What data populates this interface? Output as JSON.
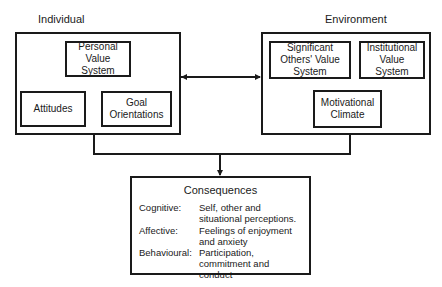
{
  "individual": {
    "title": "Individual",
    "boxes": {
      "personal_value_system": "Personal Value System",
      "attitudes": "Attitudes",
      "goal_orientations": "Goal Orientations"
    }
  },
  "environment": {
    "title": "Environment",
    "boxes": {
      "significant_others": "Significant Others' Value System",
      "institutional": "Institutional Value System",
      "motivational_climate": "Motivational Climate"
    }
  },
  "consequences": {
    "title": "Consequences",
    "rows": [
      {
        "key": "Cognitive:",
        "value": "Self, other and situational perceptions."
      },
      {
        "key": "Affective:",
        "value": "Feelings of enjoyment and anxiety"
      },
      {
        "key": "Behavioural:",
        "value": "Participation, commitment and conduct"
      }
    ]
  }
}
